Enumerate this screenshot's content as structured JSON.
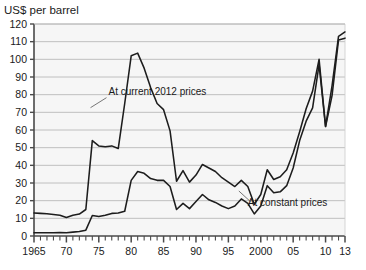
{
  "chart_data": {
    "type": "line",
    "title": "US$ per barrel",
    "xlabel": "",
    "ylabel": "US$ per barrel",
    "xlim": [
      1965,
      2013
    ],
    "ylim": [
      0,
      120
    ],
    "yticks": [
      0,
      10,
      20,
      30,
      40,
      50,
      60,
      70,
      80,
      90,
      100,
      110,
      120
    ],
    "ytick_labels": [
      "0",
      "10",
      "20",
      "30",
      "40",
      "50",
      "60",
      "70",
      "80",
      "90",
      "100",
      "110",
      "120"
    ],
    "xticks": [
      1965,
      1970,
      1975,
      1980,
      1985,
      1990,
      1995,
      2000,
      2005,
      2010,
      2013
    ],
    "xtick_labels": [
      "1965",
      "70",
      "75",
      "80",
      "85",
      "90",
      "95",
      "2000",
      "05",
      "10",
      "13"
    ],
    "minor_xtick_interval": 1,
    "grid": "horizontal",
    "legend": "inline-annotations",
    "x": [
      1965,
      1966,
      1967,
      1968,
      1969,
      1970,
      1971,
      1972,
      1973,
      1974,
      1975,
      1976,
      1977,
      1978,
      1979,
      1980,
      1981,
      1982,
      1983,
      1984,
      1985,
      1986,
      1987,
      1988,
      1989,
      1990,
      1991,
      1992,
      1993,
      1994,
      1995,
      1996,
      1997,
      1998,
      1999,
      2000,
      2001,
      2002,
      2003,
      2004,
      2005,
      2006,
      2007,
      2008,
      2009,
      2010,
      2011,
      2012,
      2013
    ],
    "series": [
      {
        "name": "At current 2012 prices",
        "annotation": "At current 2012 prices",
        "values": [
          13,
          12.8,
          12.6,
          12.2,
          11.8,
          10.5,
          11.8,
          12.4,
          15.0,
          54.0,
          51.0,
          50.5,
          51.0,
          49.5,
          75.0,
          102.0,
          103.5,
          95.0,
          84.0,
          75.0,
          71.5,
          59.5,
          31.0,
          37.0,
          30.5,
          34.5,
          40.5,
          38.5,
          36.5,
          33.0,
          30.5,
          28.0,
          31.5,
          28.0,
          18.0,
          23.5,
          37.5,
          32.0,
          33.5,
          37.5,
          47.0,
          59.0,
          72.0,
          82.0,
          100.0,
          62.0,
          85.0,
          113.0,
          115.5
        ]
      },
      {
        "name": "At constant prices",
        "annotation": "At constant prices",
        "values": [
          1.8,
          1.8,
          1.8,
          1.8,
          1.9,
          1.8,
          2.2,
          2.5,
          3.3,
          11.6,
          11.0,
          11.8,
          12.8,
          13.0,
          14.0,
          31.5,
          36.5,
          35.5,
          32.5,
          31.5,
          31.5,
          28.0,
          15.0,
          18.5,
          15.5,
          19.5,
          23.5,
          20.5,
          19.0,
          17.0,
          15.5,
          17.0,
          21.0,
          18.5,
          12.5,
          17.0,
          28.5,
          24.5,
          25.0,
          28.5,
          38.5,
          54.0,
          65.0,
          72.5,
          97.0,
          62.0,
          79.5,
          111.0,
          112.0
        ]
      }
    ],
    "annotations": [
      {
        "text": "At current 2012 prices",
        "x": 1976.5,
        "y": 80
      },
      {
        "text": "At constant prices",
        "x": 1998.0,
        "y": 17
      }
    ],
    "colors": {
      "plot_background": "#f6f6f6",
      "grid": "#b9b9b9",
      "axis": "#4a4a4a",
      "line": "#1d1d1d",
      "text": "#1a1a1a",
      "page_background": "#ffffff"
    }
  }
}
